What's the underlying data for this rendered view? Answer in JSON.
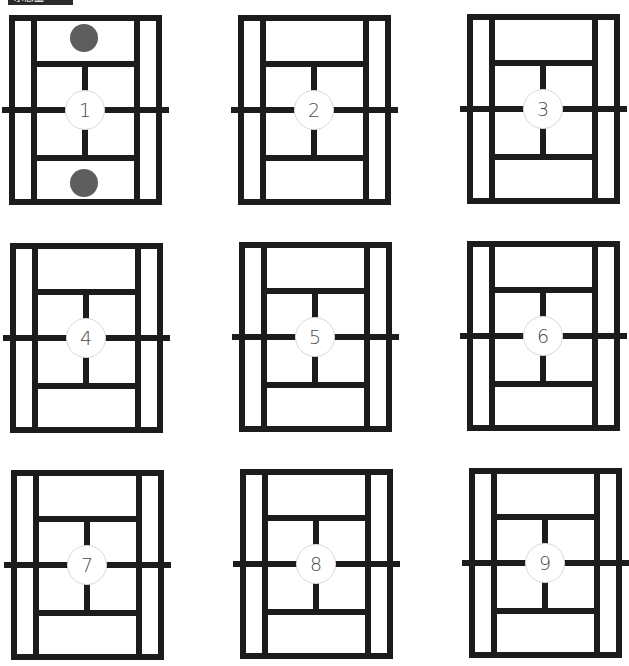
{
  "header": {
    "label": "示意圖"
  },
  "colors": {
    "line": "#1c1c1c",
    "ball": "#5e5e5e",
    "circle_border": "#d8d8d8",
    "number": "#4a4a4a"
  },
  "courts": [
    {
      "number": "1",
      "x": 9,
      "y": 15,
      "balls": [
        "top",
        "bottom"
      ]
    },
    {
      "number": "2",
      "x": 238,
      "y": 15,
      "balls": []
    },
    {
      "number": "3",
      "x": 467,
      "y": 14,
      "balls": []
    },
    {
      "number": "4",
      "x": 10,
      "y": 243,
      "balls": []
    },
    {
      "number": "5",
      "x": 239,
      "y": 242,
      "balls": []
    },
    {
      "number": "6",
      "x": 467,
      "y": 241,
      "balls": []
    },
    {
      "number": "7",
      "x": 11,
      "y": 470,
      "balls": []
    },
    {
      "number": "8",
      "x": 240,
      "y": 469,
      "balls": []
    },
    {
      "number": "9",
      "x": 469,
      "y": 468,
      "balls": []
    }
  ]
}
